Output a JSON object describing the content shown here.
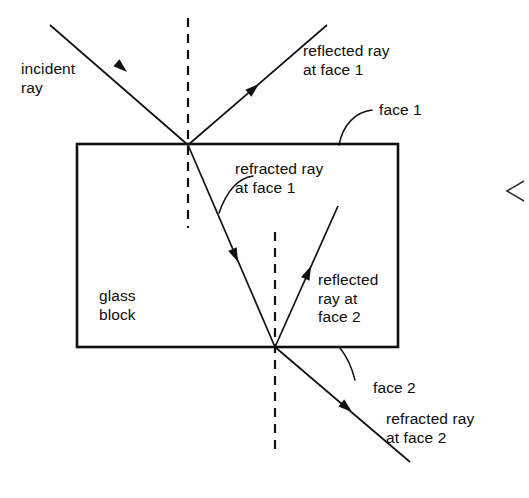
{
  "figure": {
    "background_color": "#ffffff",
    "ink_color": "#111111"
  },
  "labels": {
    "incident_ray": "incident\nray",
    "reflected_ray_face1": "reflected ray\nat face 1",
    "face1": "face 1",
    "refracted_ray_face1": "refracted ray\nat face 1",
    "glass_block": "glass\nblock",
    "reflected_ray_face2": "reflected\nray at\nface 2",
    "face2": "face 2",
    "refracted_ray_face2": "refracted ray\nat face 2"
  },
  "diagram": {
    "glass_block": {
      "left": 77,
      "top": 144,
      "right": 398,
      "bottom": 347
    },
    "points": {
      "face1_hit": {
        "x": 188,
        "y": 145
      },
      "face2_hit": {
        "x": 275,
        "y": 347
      }
    },
    "normals": [
      {
        "name": "normal-at-face-1",
        "x": 188,
        "y1": 18,
        "y2": 228
      },
      {
        "name": "normal-at-face-2",
        "x": 275,
        "y1": 232,
        "y2": 455
      }
    ],
    "rays": [
      {
        "name": "incident-ray",
        "x1": 50,
        "y1": 25,
        "x2": 188,
        "y2": 145,
        "arrow_at": {
          "x": 127,
          "y": 72
        }
      },
      {
        "name": "reflected-ray-at-face-1",
        "x1": 188,
        "y1": 145,
        "x2": 327,
        "y2": 25,
        "arrow_at": {
          "x": 259,
          "y": 84
        }
      },
      {
        "name": "refracted-ray-at-face-1",
        "x1": 188,
        "y1": 145,
        "x2": 275,
        "y2": 347,
        "arrow_at": {
          "x": 238,
          "y": 262
        }
      },
      {
        "name": "reflected-ray-at-face-2",
        "x1": 275,
        "y1": 347,
        "x2": 338,
        "y2": 206,
        "arrow_at": {
          "x": 311,
          "y": 266
        }
      },
      {
        "name": "refracted-ray-at-face-2",
        "x1": 275,
        "y1": 347,
        "x2": 410,
        "y2": 462,
        "arrow_at": {
          "x": 352,
          "y": 412
        }
      }
    ],
    "leaders": [
      {
        "name": "leader-face-1",
        "path": "M 372 110 C 356 112, 343 124, 339 145"
      },
      {
        "name": "leader-refracted-face-1",
        "path": "M 253 176 C 239 178, 227 190, 219 213"
      },
      {
        "name": "leader-face-2",
        "path": "M 355 380 C 352 368, 348 358, 340 348"
      }
    ],
    "chevron": {
      "name": "page-edge-chevron",
      "path": "M 524 181 L 507 191 L 524 201"
    }
  },
  "label_positions": {
    "incident_ray": {
      "x": 21,
      "y": 60
    },
    "reflected_ray_face1": {
      "x": 303,
      "y": 42
    },
    "face1": {
      "x": 379,
      "y": 101
    },
    "refracted_ray_face1": {
      "x": 235,
      "y": 160
    },
    "glass_block": {
      "x": 99,
      "y": 287
    },
    "reflected_ray_face2": {
      "x": 318,
      "y": 271
    },
    "face2": {
      "x": 373,
      "y": 379
    },
    "refracted_ray_face2": {
      "x": 386,
      "y": 410
    }
  }
}
